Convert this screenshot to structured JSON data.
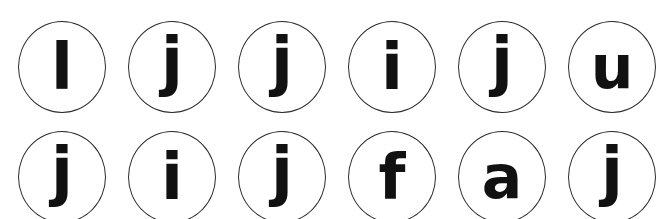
{
  "canvas": {
    "width": 663,
    "height": 219,
    "background": "#ffffff"
  },
  "style": {
    "circle_stroke_color": "#2b2b2b",
    "glyph_color": "#111111",
    "circle_fill": "#ffffff"
  },
  "grid": {
    "columns": 6,
    "rows": 2,
    "circle_width": 88,
    "circle_height": 92,
    "column_pitch": 110,
    "row_pitch": 110,
    "origin_x": 18,
    "origin_y": 21,
    "note_bottom_row_cropped": true
  },
  "cells": [
    {
      "row": 0,
      "col": 0,
      "letter": "l",
      "has_dot": false,
      "has_descender": false,
      "x": 18,
      "y": 21
    },
    {
      "row": 0,
      "col": 1,
      "letter": "j",
      "has_dot": true,
      "has_descender": true,
      "x": 128,
      "y": 21
    },
    {
      "row": 0,
      "col": 2,
      "letter": "j",
      "has_dot": true,
      "has_descender": true,
      "x": 238,
      "y": 21
    },
    {
      "row": 0,
      "col": 3,
      "letter": "i",
      "has_dot": true,
      "has_descender": false,
      "x": 348,
      "y": 21
    },
    {
      "row": 0,
      "col": 4,
      "letter": "j",
      "has_dot": true,
      "has_descender": true,
      "x": 458,
      "y": 21
    },
    {
      "row": 0,
      "col": 5,
      "letter": "u",
      "has_dot": false,
      "has_descender": false,
      "x": 568,
      "y": 21
    },
    {
      "row": 1,
      "col": 0,
      "letter": "j",
      "has_dot": true,
      "has_descender": true,
      "x": 18,
      "y": 131
    },
    {
      "row": 1,
      "col": 1,
      "letter": "i",
      "has_dot": true,
      "has_descender": false,
      "x": 128,
      "y": 131
    },
    {
      "row": 1,
      "col": 2,
      "letter": "j",
      "has_dot": true,
      "has_descender": true,
      "x": 238,
      "y": 131
    },
    {
      "row": 1,
      "col": 3,
      "letter": "f",
      "has_dot": false,
      "has_descender": false,
      "x": 348,
      "y": 131
    },
    {
      "row": 1,
      "col": 4,
      "letter": "a",
      "has_dot": false,
      "has_descender": false,
      "x": 458,
      "y": 131
    },
    {
      "row": 1,
      "col": 5,
      "letter": "j",
      "has_dot": true,
      "has_descender": true,
      "x": 568,
      "y": 131
    }
  ],
  "sequence": {
    "row_0": "l j j i j u",
    "row_1": "j i j f a j",
    "all_letters": "l, j, j, i, j, u, j, i, j, f, a, j"
  }
}
